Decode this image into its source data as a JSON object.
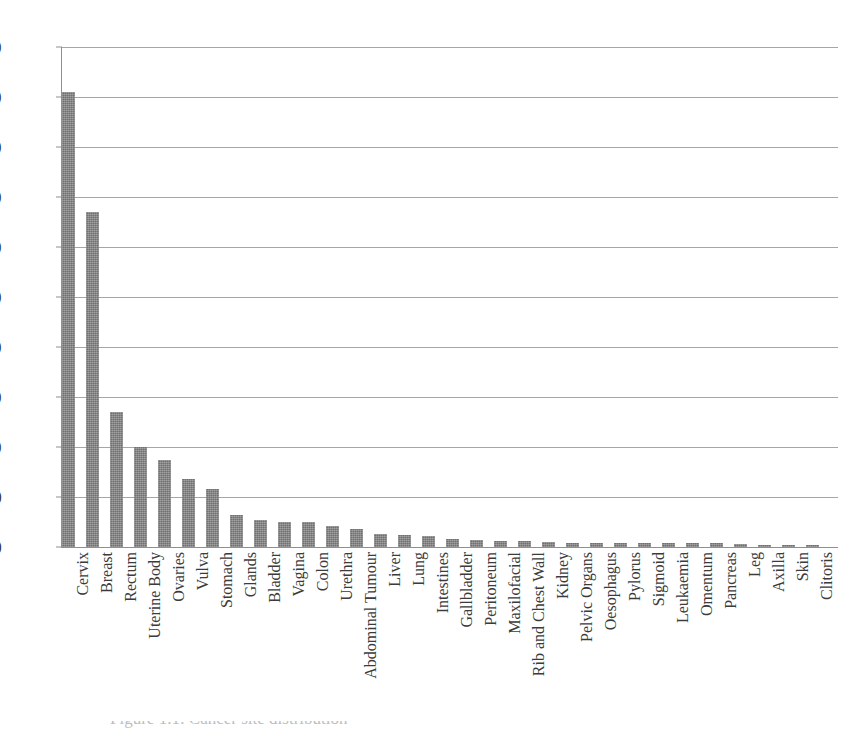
{
  "chart_data": {
    "type": "bar",
    "title": "",
    "xlabel": "",
    "ylabel": "",
    "ylim": [
      0,
      500
    ],
    "ytick_step": 50,
    "yticks": [
      500,
      450,
      400,
      350,
      300,
      250,
      200,
      150,
      100,
      50,
      0
    ],
    "grid": true,
    "legend": false,
    "bar_color": "#7d7d7d",
    "gridline_color": "#a6a6a6",
    "axis_color": "#8f8f8f",
    "label_rotation_deg": -90,
    "categories": [
      "Cervix",
      "Breast",
      "Rectum",
      "Uterine Body",
      "Ovaries",
      "Vulva",
      "Stomach",
      "Glands",
      "Bladder",
      "Vagina",
      "Colon",
      "Urethra",
      "Abdominal Tumour",
      "Liver",
      "Lung",
      "Intestines",
      "Gallbladder",
      "Peritoneum",
      "Maxilofacial",
      "Rib and Chest Wall",
      "Kidney",
      "Pelvic Organs",
      "Oesophagus",
      "Pylorus",
      "Sigmoid",
      "Leukaemia",
      "Omentum",
      "Pancreas",
      "Leg",
      "Axilla",
      "Skin",
      "Clitoris"
    ],
    "values": [
      455,
      335,
      135,
      100,
      87,
      68,
      58,
      32,
      27,
      25,
      25,
      21,
      18,
      13,
      12,
      11,
      8,
      7,
      6,
      6,
      5,
      4,
      4,
      4,
      4,
      4,
      4,
      4,
      3,
      2,
      2,
      2
    ]
  },
  "caption": {
    "text": "Figure 1.1: Cancer site distribution"
  }
}
